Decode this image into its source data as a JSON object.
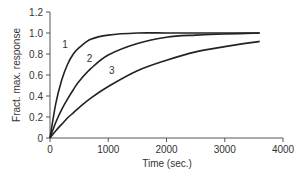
{
  "chart_data": {
    "type": "line",
    "title": "",
    "xlabel": "Time (sec.)",
    "ylabel": "Fract. max. response",
    "xlim": [
      0,
      4000
    ],
    "ylim": [
      0,
      1.2
    ],
    "xticks": [
      0,
      1000,
      2000,
      3000,
      4000
    ],
    "xtick_labels": [
      "0",
      "1000",
      "2000",
      "3000",
      "4000"
    ],
    "yticks": [
      0,
      0.2,
      0.4,
      0.6,
      0.8,
      1.0,
      1.2
    ],
    "ytick_labels": [
      "0",
      "0.2",
      "0.4",
      "0.6",
      "0.8",
      "1.0",
      "1.2"
    ],
    "grid": false,
    "legend": "none (curves labeled inline)",
    "series": [
      {
        "name": "1",
        "x": [
          0,
          100,
          200,
          300,
          400,
          500,
          700,
          1000,
          1500,
          2000,
          2500,
          3000,
          3600
        ],
        "values": [
          0,
          0.33,
          0.55,
          0.7,
          0.8,
          0.86,
          0.94,
          0.98,
          1.0,
          1.0,
          1.0,
          1.0,
          1.0
        ],
        "label_pos": {
          "x": 280,
          "y": 0.86
        }
      },
      {
        "name": "2",
        "x": [
          0,
          100,
          200,
          300,
          400,
          500,
          700,
          1000,
          1500,
          2000,
          2500,
          3000,
          3600
        ],
        "values": [
          0,
          0.15,
          0.27,
          0.37,
          0.46,
          0.54,
          0.66,
          0.79,
          0.9,
          0.96,
          0.98,
          0.99,
          1.0
        ],
        "label_pos": {
          "x": 700,
          "y": 0.72
        }
      },
      {
        "name": "3",
        "x": [
          0,
          100,
          200,
          300,
          400,
          500,
          700,
          1000,
          1500,
          2000,
          2500,
          3000,
          3600
        ],
        "values": [
          0,
          0.07,
          0.13,
          0.19,
          0.24,
          0.29,
          0.38,
          0.49,
          0.64,
          0.74,
          0.82,
          0.87,
          0.92
        ],
        "label_pos": {
          "x": 1080,
          "y": 0.61
        }
      }
    ]
  },
  "colors": {
    "line": "#222222",
    "axis": "#555555",
    "text": "#333333",
    "background": "#ffffff"
  }
}
